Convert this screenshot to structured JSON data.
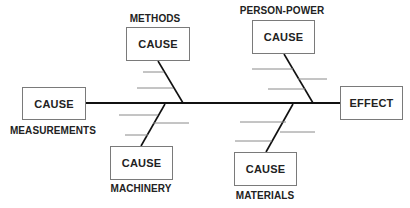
{
  "diagram": {
    "type": "fishbone",
    "effect": {
      "label": "EFFECT"
    },
    "categories": [
      {
        "name": "METHODS",
        "box_label": "CAUSE",
        "position": "top-left"
      },
      {
        "name": "PERSON-POWER",
        "box_label": "CAUSE",
        "position": "top-right"
      },
      {
        "name": "MEASUREMENTS",
        "box_label": "CAUSE",
        "position": "left"
      },
      {
        "name": "MACHINERY",
        "box_label": "CAUSE",
        "position": "bottom-left"
      },
      {
        "name": "MATERIALS",
        "box_label": "CAUSE",
        "position": "bottom-right"
      }
    ]
  },
  "colors": {
    "spine": "#111111",
    "rib": "#8a8a8a",
    "box_border": "#7a7a7a",
    "text": "#222222"
  }
}
